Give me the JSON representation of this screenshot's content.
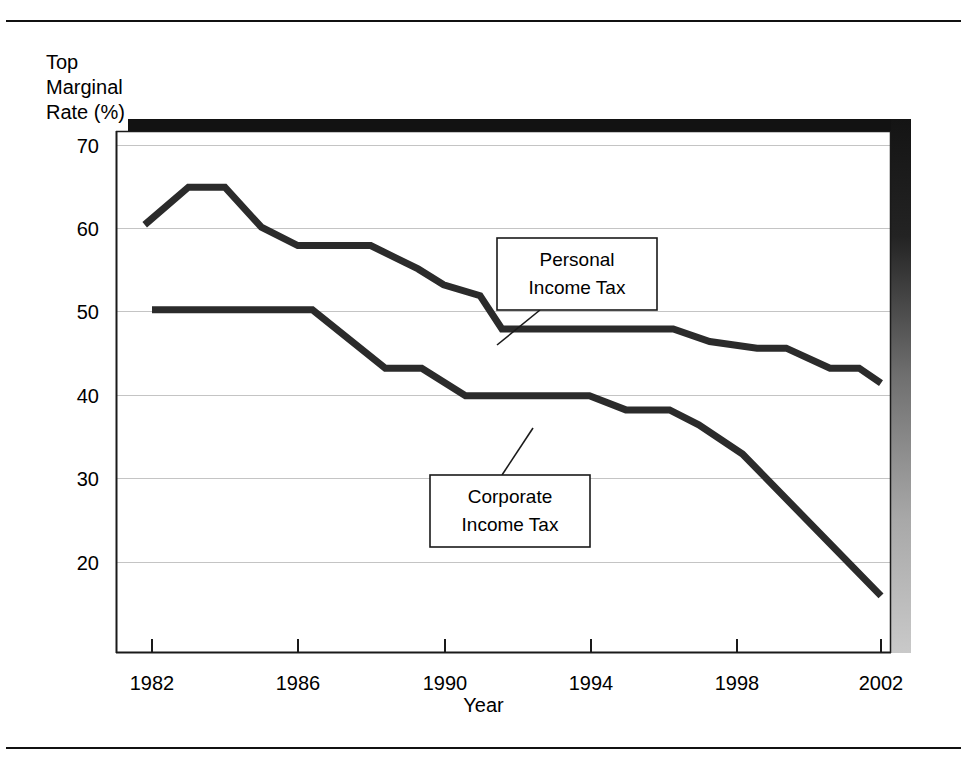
{
  "figure": {
    "y_axis_title": "Top\nMarginal\nRate (%)",
    "x_axis_title": "Year"
  },
  "chart_data": {
    "type": "line",
    "title": "",
    "xlabel": "Year",
    "ylabel": "Top Marginal Rate (%)",
    "xlim": [
      1981.7,
      2002.2
    ],
    "ylim": [
      14.5,
      72.5
    ],
    "xticks": [
      1982,
      1986,
      1990,
      1994,
      1998,
      2002
    ],
    "xtick_labels": [
      "1982",
      "1986",
      "1990",
      "1994",
      "1998",
      "2002"
    ],
    "yticks": [
      20,
      30,
      40,
      50,
      60,
      70
    ],
    "ytick_labels": [
      "20",
      "30",
      "40",
      "50",
      "60",
      "70"
    ],
    "grid": true,
    "grid_axis": "y",
    "legend": "annotations",
    "series": [
      {
        "name": "Personal Income Tax",
        "color": "#2b2b2b",
        "x": [
          1981.8,
          1983.0,
          1984.0,
          1985.0,
          1986.0,
          1987.3,
          1988.0,
          1989.3,
          1990.0,
          1991.0,
          1991.6,
          1996.3,
          1997.3,
          1998.6,
          1999.4,
          2000.6,
          2001.4,
          2002.0
        ],
        "y": [
          60.5,
          65.0,
          65.0,
          60.2,
          58.0,
          58.0,
          58.0,
          55.2,
          53.3,
          52.0,
          48.0,
          48.0,
          46.5,
          45.7,
          45.7,
          43.3,
          43.3,
          41.5
        ]
      },
      {
        "name": "Corporate Income Tax",
        "color": "#2b2b2b",
        "x": [
          1982.0,
          1986.4,
          1988.4,
          1989.4,
          1990.6,
          1994.0,
          1995.0,
          1996.2,
          1997.0,
          1998.2,
          2002.0
        ],
        "y": [
          50.3,
          50.3,
          43.3,
          43.3,
          40.0,
          40.0,
          38.3,
          38.3,
          36.5,
          33.0,
          16.0
        ]
      }
    ],
    "annotations": [
      {
        "label": "Personal\nIncome Tax",
        "lines": [
          "Personal",
          "Income Tax"
        ],
        "box": {
          "x": 497,
          "y": 216,
          "w": 160,
          "h": 72
        },
        "leader": {
          "x1": 540,
          "y1": 288,
          "x2": 497,
          "y2": 323
        }
      },
      {
        "label": "Corporate\nIncome Tax",
        "lines": [
          "Corporate",
          "Income Tax"
        ],
        "box": {
          "x": 430,
          "y": 453,
          "w": 160,
          "h": 72
        },
        "leader": {
          "x1": 502,
          "y1": 453,
          "x2": 533,
          "y2": 406
        }
      }
    ]
  }
}
